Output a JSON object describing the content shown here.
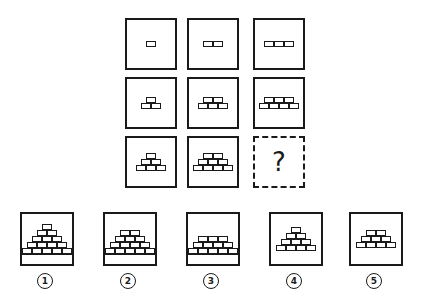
{
  "puzzle": {
    "grid": [
      {
        "row": 0,
        "col": 0,
        "rows": [
          1
        ]
      },
      {
        "row": 0,
        "col": 1,
        "rows": [
          2
        ]
      },
      {
        "row": 0,
        "col": 2,
        "rows": [
          3
        ]
      },
      {
        "row": 1,
        "col": 0,
        "rows": [
          1,
          2
        ]
      },
      {
        "row": 1,
        "col": 1,
        "rows": [
          2,
          3
        ]
      },
      {
        "row": 1,
        "col": 2,
        "rows": [
          3,
          4
        ]
      },
      {
        "row": 2,
        "col": 0,
        "rows": [
          1,
          2,
          3
        ]
      },
      {
        "row": 2,
        "col": 1,
        "rows": [
          2,
          3,
          4
        ]
      },
      {
        "row": 2,
        "col": 2,
        "missing": true,
        "text": "?"
      }
    ],
    "options": [
      {
        "label": "①",
        "rows": [
          1,
          2,
          3,
          4,
          5
        ],
        "ground": true
      },
      {
        "label": "②",
        "rows": [
          2,
          3,
          4,
          5
        ],
        "ground": true
      },
      {
        "label": "③",
        "rows": [
          3,
          4,
          5
        ],
        "ground": true
      },
      {
        "label": "④",
        "rows": [
          1,
          2,
          3,
          4
        ],
        "ground": false
      },
      {
        "label": "⑤",
        "rows": [
          2,
          3,
          4
        ],
        "ground": false
      }
    ]
  }
}
